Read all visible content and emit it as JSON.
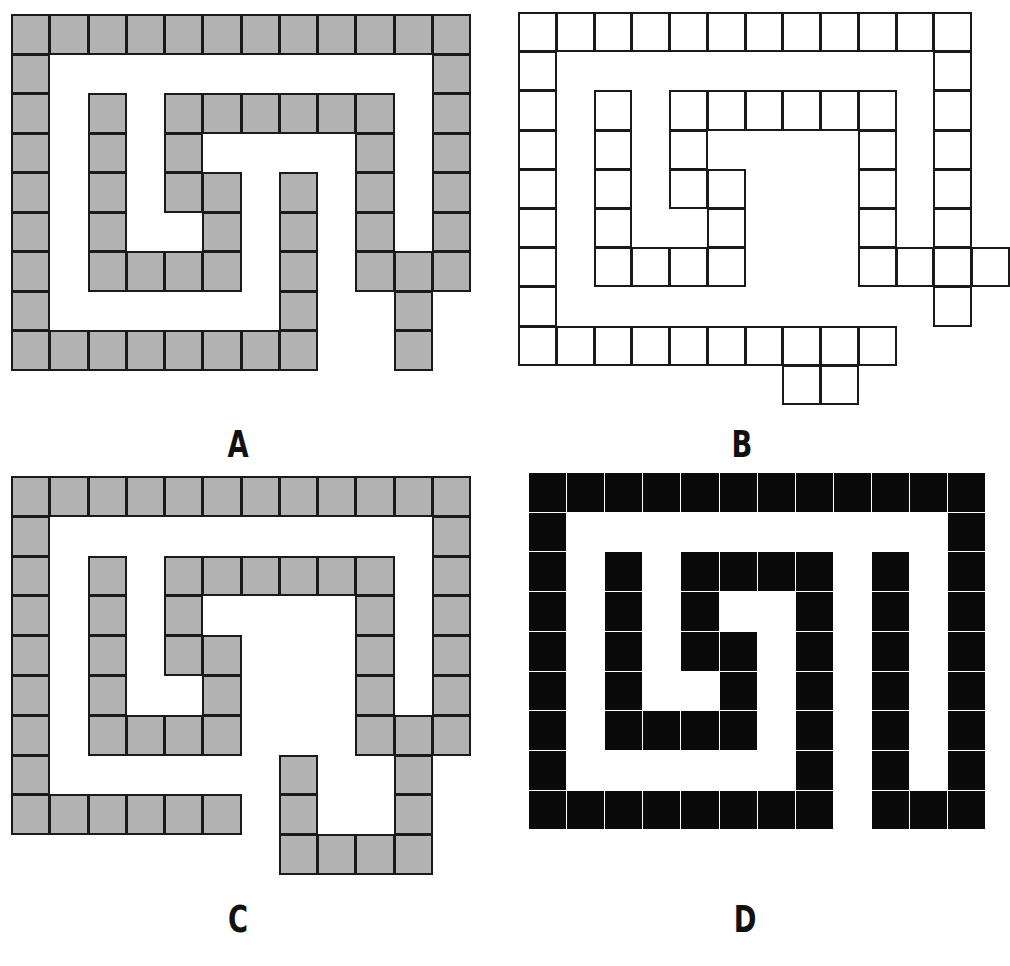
{
  "figures": [
    {
      "id": "A",
      "label": "A",
      "style": "gray",
      "fill_color": "#b3b3b3",
      "origin": [
        12,
        15
      ],
      "cell": [
        38.25,
        39.5
      ],
      "label_pos": [
        208,
        425
      ],
      "rows": [
        [
          0,
          1,
          2,
          3,
          4,
          5,
          6,
          7,
          8,
          9,
          10,
          11
        ],
        [
          0,
          11
        ],
        [
          0,
          2,
          4,
          5,
          6,
          7,
          8,
          9,
          11
        ],
        [
          0,
          2,
          4,
          9,
          11
        ],
        [
          0,
          2,
          4,
          5,
          7,
          9,
          11
        ],
        [
          0,
          2,
          5,
          7,
          9,
          11
        ],
        [
          0,
          2,
          3,
          4,
          5,
          7,
          9,
          10,
          11
        ],
        [
          0,
          7,
          10
        ],
        [
          0,
          1,
          2,
          3,
          4,
          5,
          6,
          7,
          10
        ]
      ]
    },
    {
      "id": "B",
      "label": "B",
      "style": "outline",
      "fill_color": "#ffffff",
      "origin": [
        519,
        13
      ],
      "cell": [
        37.75,
        39.2
      ],
      "label_pos": [
        712,
        425
      ],
      "rows": [
        [
          0,
          1,
          2,
          3,
          4,
          5,
          6,
          7,
          8,
          9,
          10,
          11
        ],
        [
          0,
          11
        ],
        [
          0,
          2,
          4,
          5,
          6,
          7,
          8,
          9,
          11
        ],
        [
          0,
          2,
          4,
          9,
          11
        ],
        [
          0,
          2,
          4,
          5,
          9,
          11
        ],
        [
          0,
          2,
          5,
          9,
          11
        ],
        [
          0,
          2,
          3,
          4,
          5,
          9,
          10,
          11,
          12
        ],
        [
          0,
          11
        ],
        [
          0,
          1,
          2,
          3,
          4,
          5,
          6,
          7,
          8,
          9
        ],
        [
          7,
          8
        ]
      ]
    },
    {
      "id": "C",
      "label": "C",
      "style": "gray",
      "fill_color": "#b3b3b3",
      "origin": [
        12,
        477
      ],
      "cell": [
        38.25,
        39.8
      ],
      "label_pos": [
        208,
        900
      ],
      "rows": [
        [
          0,
          1,
          2,
          3,
          4,
          5,
          6,
          7,
          8,
          9,
          10,
          11
        ],
        [
          0,
          11
        ],
        [
          0,
          2,
          4,
          5,
          6,
          7,
          8,
          9,
          11
        ],
        [
          0,
          2,
          4,
          9,
          11
        ],
        [
          0,
          2,
          4,
          5,
          9,
          11
        ],
        [
          0,
          2,
          5,
          9,
          11
        ],
        [
          0,
          2,
          3,
          4,
          5,
          9,
          10,
          11
        ],
        [
          0,
          7,
          10
        ],
        [
          0,
          1,
          2,
          3,
          4,
          5,
          7,
          10
        ],
        [
          7,
          8,
          9,
          10
        ]
      ]
    },
    {
      "id": "D",
      "label": "D",
      "style": "black",
      "fill_color": "#0a0a0a",
      "origin": [
        528,
        472
      ],
      "cell": [
        38.1,
        39.7
      ],
      "label_pos": [
        715,
        900
      ],
      "rows": [
        [
          0,
          1,
          2,
          3,
          4,
          5,
          6,
          7,
          8,
          9,
          10,
          11
        ],
        [
          0,
          11
        ],
        [
          0,
          2,
          4,
          5,
          6,
          7,
          9,
          11
        ],
        [
          0,
          2,
          4,
          7,
          9,
          11
        ],
        [
          0,
          2,
          4,
          5,
          7,
          9,
          11
        ],
        [
          0,
          2,
          5,
          7,
          9,
          11
        ],
        [
          0,
          2,
          3,
          4,
          5,
          7,
          9,
          11
        ],
        [
          0,
          7,
          9,
          11
        ],
        [
          0,
          1,
          2,
          3,
          4,
          5,
          6,
          7,
          9,
          10,
          11
        ]
      ]
    }
  ]
}
